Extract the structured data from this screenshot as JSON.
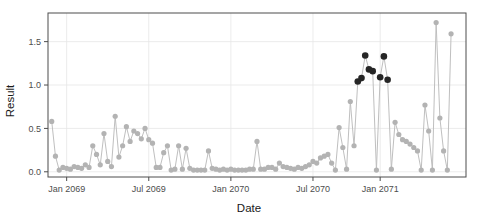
{
  "chart_data": {
    "type": "line",
    "title": "",
    "xlabel": "Date",
    "ylabel": "Result",
    "grid": true,
    "legend": false,
    "ylim": [
      -0.06,
      1.83
    ],
    "yticks": [
      0.0,
      0.5,
      1.0,
      1.5
    ],
    "ytick_labels": [
      "0.0",
      "0.5",
      "1.0",
      "1.5"
    ],
    "xlim": [
      0,
      112
    ],
    "xticks": [
      5,
      27,
      49,
      71,
      89
    ],
    "xtick_labels": [
      "Jan 2069",
      "Jul 2069",
      "Jan 2070",
      "Jul 2070",
      "Jan 2071"
    ],
    "series": [
      {
        "name": "Result",
        "point_color": "#b3b3b3",
        "line_color": "#bfbfbf",
        "highlight_color": "#262626",
        "x": [
          1,
          2,
          3,
          4,
          5,
          6,
          7,
          8,
          9,
          10,
          11,
          12,
          13,
          14,
          15,
          16,
          17,
          18,
          19,
          20,
          21,
          22,
          23,
          24,
          25,
          26,
          27,
          28,
          29,
          30,
          31,
          32,
          33,
          34,
          35,
          36,
          37,
          38,
          39,
          40,
          41,
          42,
          43,
          44,
          45,
          46,
          47,
          48,
          49,
          50,
          51,
          52,
          53,
          54,
          55,
          56,
          57,
          58,
          59,
          60,
          61,
          62,
          63,
          64,
          65,
          66,
          67,
          68,
          69,
          70,
          71,
          72,
          73,
          74,
          75,
          76,
          77,
          78,
          79,
          80,
          81,
          82,
          83,
          84,
          85,
          86,
          87,
          88,
          89,
          90,
          91,
          92,
          93,
          94,
          95,
          96,
          97,
          98,
          99,
          100,
          101,
          102,
          103,
          104,
          105,
          106,
          107,
          108
        ],
        "values": [
          0.58,
          0.18,
          0.02,
          0.05,
          0.04,
          0.03,
          0.06,
          0.05,
          0.04,
          0.08,
          0.05,
          0.3,
          0.2,
          0.08,
          0.44,
          0.12,
          0.06,
          0.64,
          0.17,
          0.3,
          0.52,
          0.35,
          0.47,
          0.44,
          0.38,
          0.5,
          0.37,
          0.33,
          0.05,
          0.05,
          0.22,
          0.3,
          0.02,
          0.03,
          0.3,
          0.03,
          0.27,
          0.04,
          0.02,
          0.02,
          0.02,
          0.02,
          0.24,
          0.04,
          0.03,
          0.02,
          0.03,
          0.02,
          0.03,
          0.02,
          0.02,
          0.02,
          0.02,
          0.03,
          0.03,
          0.35,
          0.03,
          0.03,
          0.05,
          0.05,
          0.03,
          0.1,
          0.06,
          0.05,
          0.04,
          0.03,
          0.05,
          0.04,
          0.06,
          0.08,
          0.12,
          0.1,
          0.16,
          0.18,
          0.2,
          0.1,
          0.02,
          0.51,
          0.28,
          0.03,
          0.81,
          0.3,
          1.04,
          1.08,
          1.34,
          1.18,
          1.16,
          0.02,
          1.09,
          1.33,
          1.06,
          0.03,
          0.57,
          0.43,
          0.37,
          0.35,
          0.32,
          0.28,
          0.24,
          0.02,
          0.77,
          0.47,
          0.02,
          1.72,
          0.62,
          0.24,
          0.02,
          1.59
        ],
        "highlight_indices": [
          82,
          83,
          84,
          85,
          86,
          88,
          89,
          90
        ]
      }
    ]
  },
  "colors": {
    "background": "#ffffff",
    "frame": "#4d4d4d",
    "grid": "#e6e6e6",
    "point": "#b3b3b3",
    "line": "#bfbfbf",
    "highlight": "#262626",
    "tick_text": "#4d4d4d",
    "title_text": "#1a1a1a"
  }
}
